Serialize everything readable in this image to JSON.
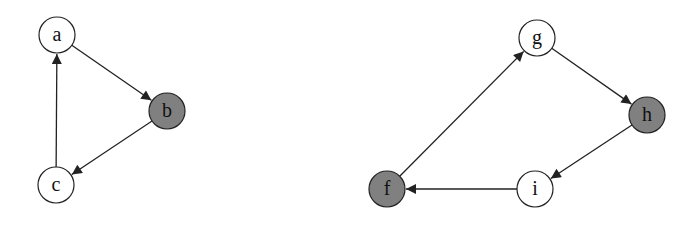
{
  "diagram": {
    "type": "directed-graph",
    "colors": {
      "edge": "#222222",
      "node_stroke": "#222222",
      "node_fill_white": "#ffffff",
      "node_fill_gray": "#808080"
    },
    "graphs": [
      {
        "nodes": [
          {
            "id": "a",
            "label": "a",
            "x": 57,
            "y": 35,
            "filled": false
          },
          {
            "id": "b",
            "label": "b",
            "x": 167,
            "y": 111,
            "filled": true
          },
          {
            "id": "c",
            "label": "c",
            "x": 56,
            "y": 185,
            "filled": false
          }
        ],
        "edges": [
          {
            "from": "a",
            "to": "b"
          },
          {
            "from": "b",
            "to": "c"
          },
          {
            "from": "c",
            "to": "a"
          }
        ]
      },
      {
        "nodes": [
          {
            "id": "g",
            "label": "g",
            "x": 537,
            "y": 38,
            "filled": false
          },
          {
            "id": "h",
            "label": "h",
            "x": 647,
            "y": 115,
            "filled": true
          },
          {
            "id": "i",
            "label": "i",
            "x": 535,
            "y": 189,
            "filled": false
          },
          {
            "id": "f",
            "label": "f",
            "x": 387,
            "y": 189,
            "filled": true
          }
        ],
        "edges": [
          {
            "from": "f",
            "to": "g"
          },
          {
            "from": "g",
            "to": "h"
          },
          {
            "from": "h",
            "to": "i"
          },
          {
            "from": "i",
            "to": "f"
          }
        ]
      }
    ]
  }
}
